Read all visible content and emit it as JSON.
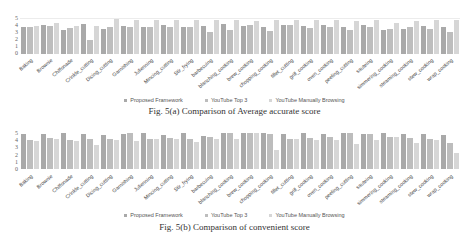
{
  "chart_data": [
    {
      "type": "bar",
      "title": "Fig. 5(a) Comparison of Average accurate score",
      "xlabel": "",
      "ylabel": "",
      "ylim": [
        0,
        5
      ],
      "yticks": [
        "0",
        "1",
        "2",
        "3",
        "4",
        "5"
      ],
      "grid": false,
      "legend_position": "bottom",
      "categories": [
        "Baking",
        "Brownie",
        "Chiffonade",
        "Crinkle_cutting",
        "Dicing_cutting",
        "Garnishing",
        "Julienning",
        "Mincing_cutting",
        "Stir_frying",
        "barbecuing",
        "blanching_cooking",
        "brew_cooking",
        "chopping_cooking",
        "fillet_cutting",
        "grill_cooking",
        "oven_cooking",
        "peeling_cutting",
        "sauteing",
        "simmering_cooking",
        "steaming_cooking",
        "stew_cooking",
        "wrap_cooking"
      ],
      "series": [
        {
          "name": "Proposed Framework",
          "color": "#a9a9a9",
          "values": [
            3.9,
            4.1,
            3.5,
            4.3,
            3.6,
            4.0,
            3.8,
            4.1,
            3.8,
            4.0,
            4.3,
            4.0,
            3.8,
            4.2,
            4.0,
            4.1,
            3.8,
            4.2,
            3.5,
            3.6,
            4.0,
            3.8
          ]
        },
        {
          "name": "YouTube Top 3",
          "color": "#bdbdbd",
          "values": [
            3.8,
            4.0,
            3.7,
            2.0,
            3.8,
            3.9,
            3.8,
            3.9,
            3.9,
            3.2,
            3.4,
            4.1,
            3.3,
            4.1,
            3.7,
            3.9,
            3.5,
            3.9,
            3.6,
            3.9,
            3.6,
            3.2
          ]
        },
        {
          "name": "YouTube Manually Browsing",
          "color": "#d6d6d6",
          "values": [
            4.0,
            4.4,
            4.0,
            4.0,
            5.0,
            4.9,
            4.9,
            4.8,
            4.8,
            4.9,
            4.9,
            4.7,
            4.9,
            4.8,
            4.8,
            4.9,
            4.7,
            4.8,
            4.5,
            4.7,
            4.8,
            4.9
          ]
        }
      ]
    },
    {
      "type": "bar",
      "title": "Fig. 5(b) Comparison of convenient score",
      "xlabel": "",
      "ylabel": "",
      "ylim": [
        0,
        5
      ],
      "yticks": [
        "0",
        "1",
        "2",
        "3",
        "4",
        "5"
      ],
      "grid": false,
      "legend_position": "bottom",
      "categories": [
        "Baking",
        "Brownie",
        "Chiffonade",
        "Crinkle_cutting",
        "Dicing_cutting",
        "Garnishing",
        "Julienning",
        "Mincing_cutting",
        "Stir_frying",
        "barbecuing",
        "blanching_cooking",
        "brew_cooking",
        "chopping_cooking",
        "fillet_cutting",
        "grill_cooking",
        "oven_cooking",
        "peeling_cutting",
        "sauteing",
        "simmering_cooking",
        "steaming_cooking",
        "stew_cooking",
        "wrap_cooking"
      ],
      "series": [
        {
          "name": "Proposed Framework",
          "color": "#a9a9a9",
          "values": [
            4.8,
            4.9,
            5.0,
            4.9,
            4.7,
            4.9,
            5.0,
            4.7,
            5.0,
            4.6,
            5.0,
            5.0,
            5.0,
            4.8,
            5.0,
            4.9,
            5.0,
            4.8,
            5.0,
            4.9,
            4.8,
            4.7
          ]
        },
        {
          "name": "YouTube Top 3",
          "color": "#bdbdbd",
          "values": [
            4.0,
            4.3,
            4.0,
            4.1,
            4.2,
            5.0,
            4.2,
            4.3,
            4.1,
            4.5,
            5.0,
            5.0,
            4.8,
            4.2,
            4.3,
            4.4,
            5.0,
            4.9,
            4.4,
            4.3,
            4.2,
            3.6
          ]
        },
        {
          "name": "YouTube Manually Browsing",
          "color": "#d6d6d6",
          "values": [
            3.9,
            4.1,
            3.9,
            3.4,
            4.0,
            3.9,
            4.1,
            4.1,
            3.8,
            4.2,
            4.2,
            5.0,
            2.6,
            4.2,
            4.0,
            4.0,
            3.5,
            4.0,
            4.5,
            3.6,
            4.0,
            2.2
          ]
        }
      ]
    }
  ],
  "charts": [
    {
      "caption": "Fig. 5(a) Comparison of Average accurate score",
      "legend": [
        "Proposed Framework",
        "YouTube Top 3",
        "YouTube Manually Browsing"
      ]
    },
    {
      "caption": "Fig. 5(b) Comparison of convenient score",
      "legend": [
        "Proposed Framework",
        "YouTube Top 3",
        "YouTube Manually Browsing"
      ]
    }
  ],
  "colors": {
    "proposed": "#a9a9a9",
    "top3": "#bdbdbd",
    "manual": "#d6d6d6"
  }
}
